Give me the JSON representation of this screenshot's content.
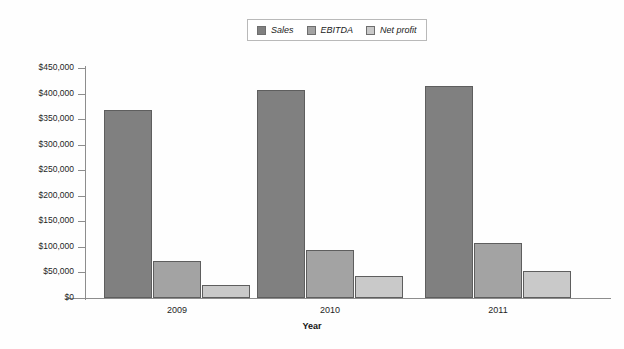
{
  "chart_data": {
    "type": "bar",
    "title": "",
    "subtitle": "",
    "xlabel": "Year",
    "ylabel": "",
    "categories": [
      "2009",
      "2010",
      "2011"
    ],
    "series": [
      {
        "name": "Sales",
        "values": [
          368000,
          407000,
          415000
        ],
        "color": "#808080"
      },
      {
        "name": "EBITDA",
        "values": [
          72000,
          94000,
          108000
        ],
        "color": "#a3a3a3"
      },
      {
        "name": "Net profit",
        "values": [
          25000,
          43000,
          53000
        ],
        "color": "#c9c9c9"
      }
    ],
    "ylim": [
      0,
      450000
    ],
    "y_ticks": [
      0,
      50000,
      100000,
      150000,
      200000,
      250000,
      300000,
      350000,
      400000,
      450000
    ],
    "y_tick_labels": [
      "$0",
      "$50,000",
      "$100,000",
      "$150,000",
      "$200,000",
      "$250,000",
      "$300,000",
      "$350,000",
      "$400,000",
      "$450,000"
    ],
    "grid": false,
    "legend_position": "top-center",
    "legend_entries": [
      "Sales",
      "EBITDA",
      "Net profit"
    ]
  },
  "legend": {
    "items": [
      {
        "label": "Sales",
        "color": "#808080"
      },
      {
        "label": "EBITDA",
        "color": "#a3a3a3"
      },
      {
        "label": "Net profit",
        "color": "#c9c9c9"
      }
    ]
  },
  "axes": {
    "x_title": "Year",
    "category_labels": [
      "2009",
      "2010",
      "2011"
    ],
    "y_tick_labels": [
      "$450,000",
      "$400,000",
      "$350,000",
      "$300,000",
      "$250,000",
      "$200,000",
      "$150,000",
      "$100,000",
      "$50,000",
      "$0"
    ]
  },
  "colors": {
    "background": "#fefefe",
    "axis": "#8d8d8d",
    "bar_border": "#5e5e5e",
    "text": "#1f1f1f"
  }
}
